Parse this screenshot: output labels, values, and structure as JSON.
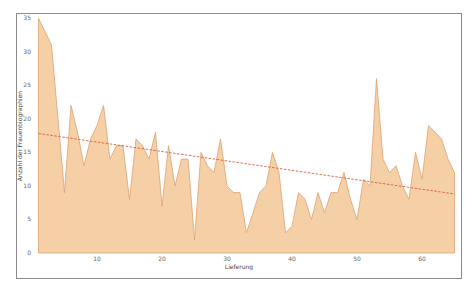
{
  "chart_data": {
    "type": "area",
    "title": "",
    "xlabel": "Lieferung",
    "ylabel": "Anzahl der Frauenbiographien",
    "xlim": [
      1,
      65
    ],
    "ylim": [
      0,
      35
    ],
    "x_ticks": [
      10,
      20,
      30,
      40,
      50,
      60
    ],
    "y_ticks": [
      0,
      5,
      10,
      15,
      20,
      25,
      30,
      35
    ],
    "grid": false,
    "legend": null,
    "x": [
      1,
      2,
      3,
      4,
      5,
      6,
      7,
      8,
      9,
      10,
      11,
      12,
      13,
      14,
      15,
      16,
      17,
      18,
      19,
      20,
      21,
      22,
      23,
      24,
      25,
      26,
      27,
      28,
      29,
      30,
      31,
      32,
      33,
      34,
      35,
      36,
      37,
      38,
      39,
      40,
      41,
      42,
      43,
      44,
      45,
      46,
      47,
      48,
      49,
      50,
      51,
      52,
      53,
      54,
      55,
      56,
      57,
      58,
      59,
      60,
      61,
      62,
      63,
      64,
      65
    ],
    "series": [
      {
        "name": "Frauenbiographien",
        "style": "area",
        "color": "#f5cfa6",
        "stroke": "#dea272",
        "values": [
          35,
          33,
          31,
          20,
          9,
          22,
          18,
          13,
          17,
          19,
          22,
          14,
          16,
          16,
          8,
          17,
          16,
          14,
          18,
          7,
          16,
          10,
          14,
          14,
          2,
          15,
          13,
          12,
          17,
          10,
          9,
          9,
          3,
          6,
          9,
          10,
          15,
          12,
          3,
          4,
          9,
          8,
          5,
          9,
          6,
          9,
          9,
          12,
          8,
          5,
          11,
          10,
          26,
          14,
          12,
          13,
          10,
          8,
          15,
          11,
          19,
          18,
          17,
          14,
          12
        ]
      },
      {
        "name": "Linearer Trend",
        "style": "dashed-line",
        "color": "#d9603b",
        "start": [
          1,
          17.8
        ],
        "end": [
          65,
          8.8
        ]
      }
    ]
  }
}
